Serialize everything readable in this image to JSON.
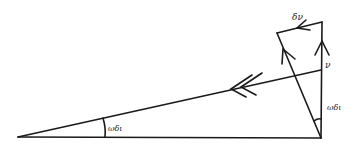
{
  "diagram": {
    "type": "vector diagram",
    "labels": {
      "delta_v": "δν",
      "v": "ν",
      "omega_dt_right": "ωδι",
      "omega_dt_left": "ωδι"
    },
    "colors": {
      "stroke": "#1a1a1a",
      "background": "#ffffff"
    }
  }
}
